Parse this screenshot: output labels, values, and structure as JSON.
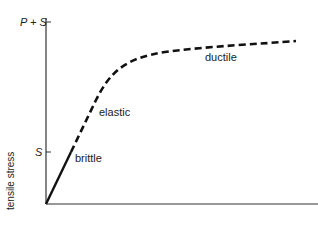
{
  "diagram": {
    "y_axis_label": "tensile stress",
    "y_ticks": [
      {
        "label": "P + S",
        "y": 22
      },
      {
        "label": "S",
        "y": 152
      }
    ],
    "regions": [
      {
        "name": "brittle",
        "label": "brittle",
        "style": "solid"
      },
      {
        "name": "elastic",
        "label": "elastic",
        "style": "dashed"
      },
      {
        "name": "ductile",
        "label": "ductile",
        "style": "dashed"
      }
    ],
    "colors": {
      "line": "#111111",
      "axis": "#333333",
      "text": "#222222"
    }
  }
}
